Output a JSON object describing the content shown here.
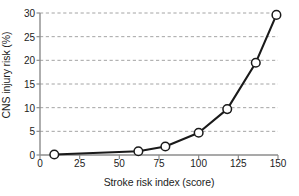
{
  "chart_data": {
    "type": "line",
    "title": "",
    "xlabel": "Stroke risk index (score)",
    "ylabel": "CNS injury risk (%)",
    "xlim": [
      0,
      150
    ],
    "ylim": [
      0,
      30
    ],
    "xticks": [
      0,
      25,
      50,
      75,
      100,
      125,
      150
    ],
    "yticks": [
      0,
      5,
      10,
      15,
      20,
      25,
      30
    ],
    "xtick_labels": [
      "0",
      "25",
      "50",
      "75",
      "100",
      "125",
      "150"
    ],
    "ytick_labels": [
      "0",
      "5",
      "10",
      "15",
      "20",
      "25",
      "30"
    ],
    "grid": "horizontal-dashed",
    "legend": "none",
    "marker": "open-circle",
    "series": [
      {
        "name": "CNS injury risk",
        "x": [
          9,
          62,
          79,
          100,
          118,
          136,
          149
        ],
        "values": [
          0.1,
          0.8,
          1.8,
          4.7,
          9.7,
          19.5,
          29.6
        ]
      }
    ],
    "colors": {
      "line": "#1a1a1a",
      "marker_fill": "#ffffff",
      "marker_stroke": "#1a1a1a",
      "grid": "#9a9a9a",
      "axis": "#8c8c8c",
      "text": "#1c1c1c"
    }
  }
}
